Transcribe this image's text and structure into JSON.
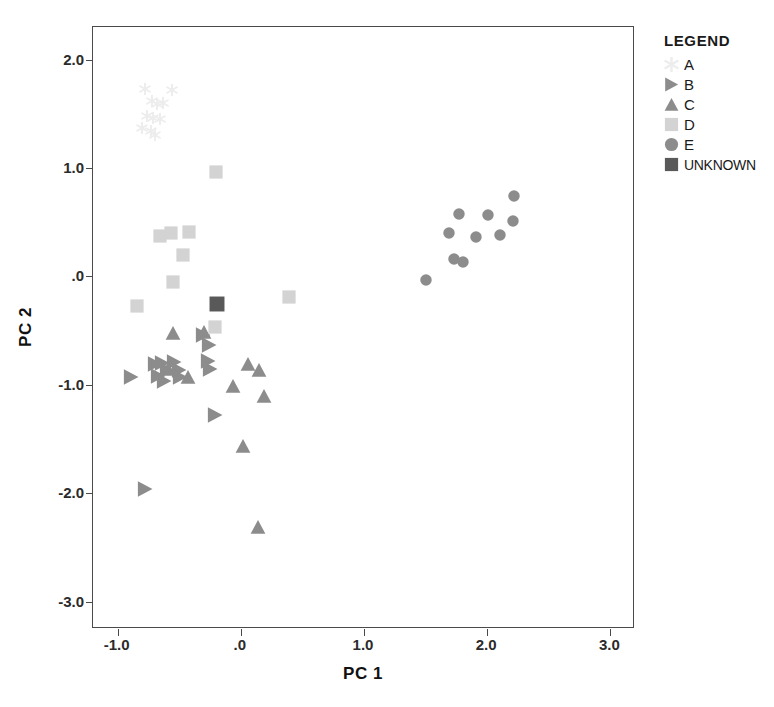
{
  "chart_data": {
    "type": "scatter",
    "title": "",
    "xlabel": "PC 1",
    "ylabel": "PC 2",
    "xlim": [
      -1.2,
      3.2
    ],
    "ylim": [
      -3.25,
      2.3
    ],
    "xticks": [
      -1.0,
      0.0,
      1.0,
      2.0,
      3.0
    ],
    "xticklabels": [
      "-1.0",
      ".0",
      "1.0",
      "2.0",
      "3.0"
    ],
    "yticks": [
      2.0,
      1.0,
      0.0,
      -1.0,
      -2.0,
      -3.0
    ],
    "yticklabels": [
      "2.0",
      "1.0",
      ".0",
      "-1.0",
      "-2.0",
      "-3.0"
    ],
    "grid": false,
    "legend_position": "upper-right-outside",
    "series": [
      {
        "name": "A",
        "marker": "star",
        "color": "#ededed",
        "points": [
          [
            -0.78,
            1.73
          ],
          [
            -0.56,
            1.72
          ],
          [
            -0.72,
            1.62
          ],
          [
            -0.68,
            1.59
          ],
          [
            -0.63,
            1.6
          ],
          [
            -0.76,
            1.48
          ],
          [
            -0.71,
            1.46
          ],
          [
            -0.66,
            1.45
          ],
          [
            -0.8,
            1.37
          ],
          [
            -0.73,
            1.34
          ],
          [
            -0.7,
            1.3
          ]
        ]
      },
      {
        "name": "B",
        "marker": "triangle-right",
        "color": "#8c8c8c",
        "points": [
          [
            -0.89,
            -0.93
          ],
          [
            -0.7,
            -0.81
          ],
          [
            -0.64,
            -0.8
          ],
          [
            -0.67,
            -0.92
          ],
          [
            -0.62,
            -0.96
          ],
          [
            -0.6,
            -0.86
          ],
          [
            -0.54,
            -0.79
          ],
          [
            -0.5,
            -0.86
          ],
          [
            -0.49,
            -0.93
          ],
          [
            -0.31,
            -0.54
          ],
          [
            -0.26,
            -0.63
          ],
          [
            -0.27,
            -0.78
          ],
          [
            -0.25,
            -0.85
          ],
          [
            -0.21,
            -1.28
          ],
          [
            -0.78,
            -1.96
          ]
        ]
      },
      {
        "name": "C",
        "marker": "triangle-up",
        "color": "#8c8c8c",
        "points": [
          [
            -0.55,
            -0.52
          ],
          [
            -0.3,
            -0.51
          ],
          [
            -0.59,
            -0.85
          ],
          [
            -0.43,
            -0.93
          ],
          [
            0.06,
            -0.81
          ],
          [
            0.15,
            -0.86
          ],
          [
            -0.06,
            -1.01
          ],
          [
            0.19,
            -1.1
          ],
          [
            0.02,
            -1.56
          ],
          [
            0.14,
            -2.31
          ]
        ]
      },
      {
        "name": "D",
        "marker": "square",
        "color": "#d3d3d3",
        "points": [
          [
            -0.2,
            0.96
          ],
          [
            -0.66,
            0.37
          ],
          [
            -0.57,
            0.4
          ],
          [
            -0.42,
            0.41
          ],
          [
            -0.47,
            0.2
          ],
          [
            -0.55,
            -0.05
          ],
          [
            -0.84,
            -0.27
          ],
          [
            0.39,
            -0.19
          ],
          [
            -0.21,
            -0.47
          ]
        ]
      },
      {
        "name": "E",
        "marker": "circle",
        "color": "#8c8c8c",
        "points": [
          [
            2.22,
            0.74
          ],
          [
            1.77,
            0.58
          ],
          [
            2.01,
            0.57
          ],
          [
            2.21,
            0.51
          ],
          [
            1.69,
            0.4
          ],
          [
            2.1,
            0.38
          ],
          [
            1.91,
            0.36
          ],
          [
            1.73,
            0.16
          ],
          [
            1.8,
            0.13
          ],
          [
            1.5,
            -0.03
          ]
        ]
      },
      {
        "name": "UNKNOWN",
        "marker": "square",
        "color": "#595959",
        "points": [
          [
            -0.19,
            -0.25
          ]
        ]
      }
    ]
  },
  "legend": {
    "title": "LEGEND",
    "entries": [
      {
        "label": "A",
        "marker": "star",
        "color": "#ededed"
      },
      {
        "label": "B",
        "marker": "triangle-right",
        "color": "#8c8c8c"
      },
      {
        "label": "C",
        "marker": "triangle-up",
        "color": "#8c8c8c"
      },
      {
        "label": "D",
        "marker": "square",
        "color": "#d3d3d3"
      },
      {
        "label": "E",
        "marker": "circle",
        "color": "#8c8c8c"
      },
      {
        "label": "UNKNOWN",
        "marker": "square",
        "color": "#595959"
      }
    ]
  }
}
